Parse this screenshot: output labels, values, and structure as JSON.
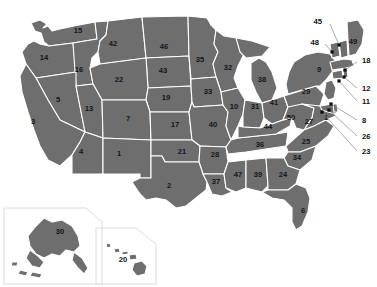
{
  "figure": {
    "kind": "choropleth-index-map",
    "region": "United States of America",
    "background_color": "#ffffff",
    "state_fill_color": "#6e6e6e",
    "state_border_color": "#ffffff",
    "label_text_color": "#111111",
    "leader_line_color": "#8a8a8a",
    "marker_color": "#0d0d0d",
    "width_px": 377,
    "height_px": 287
  },
  "chart_data": {
    "type": "map",
    "title": "",
    "subtitle": "",
    "xlabel": "",
    "ylabel": "",
    "legend": [],
    "value_kind": "index-number",
    "categories": [
      "1",
      "2",
      "3",
      "4",
      "5",
      "6",
      "7",
      "8",
      "9",
      "10",
      "11",
      "12",
      "13",
      "14",
      "15",
      "16",
      "17",
      "18",
      "19",
      "20",
      "21",
      "22",
      "23",
      "24",
      "25",
      "26",
      "27",
      "28",
      "29",
      "30",
      "31",
      "32",
      "33",
      "34",
      "35",
      "36",
      "37",
      "38",
      "39",
      "40",
      "41",
      "42",
      "43",
      "44",
      "45",
      "46",
      "47",
      "48",
      "49",
      "50"
    ],
    "values": [
      1,
      2,
      3,
      4,
      5,
      6,
      7,
      8,
      9,
      10,
      11,
      12,
      13,
      14,
      15,
      16,
      17,
      18,
      19,
      20,
      21,
      22,
      23,
      24,
      25,
      26,
      27,
      28,
      29,
      30,
      31,
      32,
      33,
      34,
      35,
      36,
      37,
      38,
      39,
      40,
      41,
      42,
      43,
      44,
      45,
      46,
      47,
      48,
      49,
      50
    ]
  },
  "map": {
    "inline_labels": [
      {
        "id": "s15",
        "number": "15",
        "x": 78,
        "y": 31
      },
      {
        "id": "s14",
        "number": "14",
        "x": 44,
        "y": 58
      },
      {
        "id": "s16",
        "number": "16",
        "x": 79,
        "y": 70
      },
      {
        "id": "s42",
        "number": "42",
        "x": 113,
        "y": 44
      },
      {
        "id": "s46",
        "number": "46",
        "x": 164,
        "y": 47
      },
      {
        "id": "s35",
        "number": "35",
        "x": 200,
        "y": 60
      },
      {
        "id": "s32",
        "number": "32",
        "x": 228,
        "y": 68
      },
      {
        "id": "s22",
        "number": "22",
        "x": 119,
        "y": 80
      },
      {
        "id": "s43",
        "number": "43",
        "x": 163,
        "y": 71
      },
      {
        "id": "s33",
        "number": "33",
        "x": 208,
        "y": 92
      },
      {
        "id": "s38",
        "number": "38",
        "x": 262,
        "y": 80
      },
      {
        "id": "s5",
        "number": "5",
        "x": 58,
        "y": 100
      },
      {
        "id": "s13",
        "number": "13",
        "x": 89,
        "y": 109
      },
      {
        "id": "s19",
        "number": "19",
        "x": 166,
        "y": 98
      },
      {
        "id": "s10",
        "number": "10",
        "x": 234,
        "y": 107
      },
      {
        "id": "s31",
        "number": "31",
        "x": 255,
        "y": 107
      },
      {
        "id": "s41",
        "number": "41",
        "x": 274,
        "y": 103
      },
      {
        "id": "s29",
        "number": "29",
        "x": 306,
        "y": 92
      },
      {
        "id": "s9",
        "number": "9",
        "x": 319,
        "y": 70
      },
      {
        "id": "s3",
        "number": "3",
        "x": 33,
        "y": 122
      },
      {
        "id": "s7",
        "number": "7",
        "x": 128,
        "y": 119
      },
      {
        "id": "s17",
        "number": "17",
        "x": 175,
        "y": 125
      },
      {
        "id": "s40",
        "number": "40",
        "x": 213,
        "y": 125
      },
      {
        "id": "s50",
        "number": "50",
        "x": 291,
        "y": 118
      },
      {
        "id": "s44",
        "number": "44",
        "x": 268,
        "y": 127
      },
      {
        "id": "s27",
        "number": "27",
        "x": 309,
        "y": 122
      },
      {
        "id": "s4",
        "number": "4",
        "x": 81,
        "y": 152
      },
      {
        "id": "s1",
        "number": "1",
        "x": 119,
        "y": 154
      },
      {
        "id": "s21",
        "number": "21",
        "x": 182,
        "y": 152
      },
      {
        "id": "s28",
        "number": "28",
        "x": 215,
        "y": 155
      },
      {
        "id": "s36",
        "number": "36",
        "x": 260,
        "y": 145
      },
      {
        "id": "s25",
        "number": "25",
        "x": 306,
        "y": 142
      },
      {
        "id": "s34",
        "number": "34",
        "x": 297,
        "y": 158
      },
      {
        "id": "s2",
        "number": "2",
        "x": 169,
        "y": 186
      },
      {
        "id": "s37",
        "number": "37",
        "x": 216,
        "y": 182
      },
      {
        "id": "s47",
        "number": "47",
        "x": 238,
        "y": 175
      },
      {
        "id": "s39",
        "number": "39",
        "x": 258,
        "y": 175
      },
      {
        "id": "s24",
        "number": "24",
        "x": 283,
        "y": 175
      },
      {
        "id": "s6",
        "number": "6",
        "x": 303,
        "y": 211
      },
      {
        "id": "s1dc",
        "number": "1",
        "x": 326,
        "y": 118
      },
      {
        "id": "s49",
        "number": "49",
        "x": 353,
        "y": 42
      },
      {
        "id": "s30",
        "number": "30",
        "x": 60,
        "y": 232
      },
      {
        "id": "s20",
        "number": "20",
        "x": 123,
        "y": 260
      }
    ],
    "callouts": [
      {
        "id": "c45",
        "number": "45",
        "label_x": 322,
        "label_y": 22,
        "anchor": "end",
        "dot_x": 339,
        "dot_y": 45,
        "bend_x": 330,
        "bend_y": 24
      },
      {
        "id": "c48",
        "number": "48",
        "label_x": 319,
        "label_y": 43,
        "anchor": "end",
        "dot_x": 332,
        "dot_y": 52,
        "bend_x": 325,
        "bend_y": 44
      },
      {
        "id": "c18",
        "number": "18",
        "label_x": 362,
        "label_y": 61,
        "anchor": "start",
        "dot_x": 345,
        "dot_y": 70,
        "bend_x": 357,
        "bend_y": 62
      },
      {
        "id": "c12",
        "number": "12",
        "label_x": 362,
        "label_y": 89,
        "anchor": "start",
        "dot_x": 344,
        "dot_y": 77,
        "bend_x": 357,
        "bend_y": 88
      },
      {
        "id": "c11",
        "number": "11",
        "label_x": 362,
        "label_y": 102,
        "anchor": "start",
        "dot_x": 339,
        "dot_y": 81,
        "bend_x": 357,
        "bend_y": 101
      },
      {
        "id": "c8",
        "number": "8",
        "label_x": 362,
        "label_y": 121,
        "anchor": "start",
        "dot_x": 331,
        "dot_y": 104,
        "bend_x": 357,
        "bend_y": 120
      },
      {
        "id": "c26",
        "number": "26",
        "label_x": 362,
        "label_y": 137,
        "anchor": "start",
        "dot_x": 329,
        "dot_y": 110,
        "bend_x": 357,
        "bend_y": 136
      },
      {
        "id": "c23",
        "number": "23",
        "label_x": 362,
        "label_y": 152,
        "anchor": "start",
        "dot_x": 322,
        "dot_y": 112,
        "bend_x": 357,
        "bend_y": 151
      }
    ]
  }
}
